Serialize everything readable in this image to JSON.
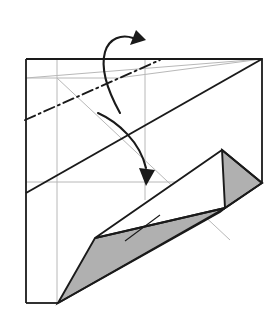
{
  "figure": {
    "step_label": "",
    "canvas": {
      "width": 279,
      "height": 319,
      "background": "#ffffff"
    }
  },
  "palette": {
    "paper_front": "#ffffff",
    "paper_back_shaded": "#b0b0b0",
    "edge_stroke": "#1a1a1a",
    "guide_crease": "#b8b8b8",
    "fold_line": "#1a1a1a"
  },
  "sheet": {
    "name": "square-sheet-outline",
    "description": "Outer paper boundary, upper portion still flat",
    "corners": {
      "top_left": [
        26,
        59
      ],
      "top_right": [
        262,
        59
      ],
      "right_mid": [
        262,
        183
      ],
      "bottom_left": [
        26,
        303
      ]
    },
    "outline_points": "26,59 262,59 262,183",
    "left_edge": "26,59 26,303",
    "bottom_edge": "26,303 58,303",
    "stroke_width": 1.8
  },
  "guides": [
    {
      "name": "guide-vertical-left",
      "points": "57,59 57,303",
      "note": "vertical quarter crease"
    },
    {
      "name": "guide-vertical-mid",
      "points": "145,59 145,200",
      "note": "vertical mid crease"
    },
    {
      "name": "guide-horizontal-mid",
      "points": "26,182 230,182",
      "note": "horizontal mid crease"
    },
    {
      "name": "guide-horizontal-upper",
      "points": "26,78 118,78",
      "note": "short upper horizontal crease"
    },
    {
      "name": "guide-diagonal-main",
      "points": "26,78 262,59",
      "note": "faint diagonal from left edge to top right"
    },
    {
      "name": "guide-diagonal-down",
      "points": "57,78 230,240",
      "note": "faint diagonal running down-right"
    },
    {
      "name": "guide-diagonal-up",
      "points": "118,78 262,59",
      "note": "faint short diagonal near top"
    }
  ],
  "creases": {
    "valley_solid": {
      "name": "diagonal-crease-solid",
      "points": "26,193 262,59",
      "stroke_width": 2.0,
      "style": "solid"
    },
    "mountain_dashdot": {
      "name": "mountain-fold-dashdot",
      "points": "25,120 160,60",
      "stroke_width": 1.9,
      "style": "dash-dot",
      "dash_pattern": "11 4 2 4"
    }
  },
  "flap": {
    "name": "folded-flap-group",
    "white_quad": {
      "name": "flap-white-face",
      "points": "222,150 95,238 225,208 262,183",
      "fill": "#ffffff"
    },
    "shaded_triangle_upper": {
      "name": "flap-shaded-triangle-upper",
      "points": "222,150 262,183 225,208",
      "fill": "#b0b0b0"
    },
    "shaded_polygon_lower": {
      "name": "flap-shaded-region-lower",
      "points": "58,303 95,238 225,208 220,212",
      "fill": "#b0b0b0"
    },
    "inner_crease": {
      "name": "flap-inner-crease",
      "points": "125,241 160,215"
    },
    "spine_line": {
      "name": "flap-spine-line",
      "points": "58,303 225,208"
    }
  },
  "arrows": [
    {
      "name": "arrow-fold-top-left",
      "description": "curved arrow at top-left turning up and over to the right",
      "path": "M 120,113 C 110,95 100,70 105,52 C 109,38 122,34 133,38",
      "head": "136,30 146,40 130,45",
      "stroke_width": 2.1
    },
    {
      "name": "arrow-fold-center",
      "description": "large curved arrow sweeping from upper-left down to the center",
      "path": "M 98,113 C 118,122 140,142 146,168",
      "head": "139,168 155,170 146,186",
      "stroke_width": 2.3
    }
  ],
  "legend": {
    "mountain_fold": "mountain fold (dash-dot)",
    "valley_fold": "valley fold (solid)",
    "existing_crease": "existing crease (light gray)",
    "shaded_meaning": "shaded = reverse side of paper"
  }
}
